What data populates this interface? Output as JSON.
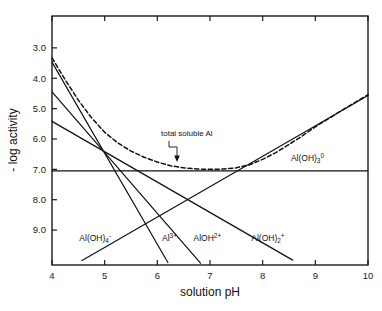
{
  "chart_data": {
    "type": "line",
    "title": "",
    "xlabel": "solution pH",
    "ylabel": "- log activity",
    "xlim": [
      4,
      10
    ],
    "ylim_inverted": [
      1.95,
      10.15
    ],
    "x_ticks": [
      "4",
      "5",
      "6",
      "7",
      "8",
      "9",
      "10"
    ],
    "y_ticks": [
      "3.0",
      "4.0",
      "5.0",
      "6.0",
      "7.0",
      "8.0",
      "9.0"
    ],
    "grid": false,
    "legend_position": "inline-labels",
    "annotations": [
      {
        "text": "total soluble Al",
        "x": 6.55,
        "y": 6.25,
        "marker": "arrow-down-to-curve"
      }
    ],
    "series": [
      {
        "name": "Al3+",
        "label": "Al",
        "label_sup": "3+",
        "style": "solid",
        "slope": -3,
        "points": [
          [
            4.0,
            3.47
          ],
          [
            6.2,
            10.07
          ]
        ],
        "label_x": 6.23,
        "label_y": 9.35
      },
      {
        "name": "AlOH2+",
        "label": "AlOH",
        "label_sup": "2+",
        "style": "solid",
        "slope": -2,
        "points": [
          [
            4.0,
            4.45
          ],
          [
            6.82,
            10.09
          ]
        ],
        "label_x": 6.95,
        "label_y": 9.35
      },
      {
        "name": "Al(OH)2+",
        "label": "Al(OH)",
        "label_sub": "2",
        "label_sup": "+",
        "style": "solid",
        "slope": -1,
        "points": [
          [
            4.0,
            5.42
          ],
          [
            8.57,
            9.99
          ]
        ],
        "label_x": 8.1,
        "label_y": 9.35
      },
      {
        "name": "Al(OH)30",
        "label": "Al(OH)",
        "label_sub": "3",
        "label_sup": "0",
        "style": "solid",
        "slope": 0,
        "points": [
          [
            4.0,
            7.05
          ],
          [
            10.0,
            7.05
          ]
        ],
        "label_x": 8.85,
        "label_y": 6.72
      },
      {
        "name": "Al(OH)4-",
        "label": "Al(OH)",
        "label_sub": "4",
        "label_sup": "-",
        "style": "solid",
        "slope": 1,
        "points": [
          [
            4.57,
            10.0
          ],
          [
            10.0,
            4.57
          ]
        ],
        "label_x": 4.82,
        "label_y": 9.35
      },
      {
        "name": "total soluble Al",
        "style": "dashed",
        "points": [
          [
            4.0,
            3.33
          ],
          [
            4.25,
            4.05
          ],
          [
            4.5,
            4.72
          ],
          [
            4.75,
            5.3
          ],
          [
            5.0,
            5.78
          ],
          [
            5.25,
            6.13
          ],
          [
            5.5,
            6.4
          ],
          [
            5.75,
            6.6
          ],
          [
            6.0,
            6.76
          ],
          [
            6.25,
            6.88
          ],
          [
            6.5,
            6.95
          ],
          [
            6.75,
            6.99
          ],
          [
            7.0,
            7.0
          ],
          [
            7.25,
            6.99
          ],
          [
            7.5,
            6.95
          ],
          [
            7.75,
            6.85
          ],
          [
            8.0,
            6.67
          ],
          [
            8.25,
            6.45
          ],
          [
            8.5,
            6.18
          ],
          [
            8.75,
            5.9
          ],
          [
            9.0,
            5.6
          ],
          [
            9.25,
            5.33
          ],
          [
            9.5,
            5.06
          ],
          [
            9.75,
            4.8
          ],
          [
            10.0,
            4.54
          ]
        ]
      }
    ]
  },
  "axes": {
    "x_title": "solution pH",
    "y_title": "- log activity"
  }
}
